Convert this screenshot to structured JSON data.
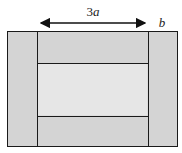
{
  "diagram": {
    "type": "rectangular-frame",
    "labels": {
      "width_label": "3a",
      "border_label": "b"
    },
    "colors": {
      "background": "#ffffff",
      "border_band": "#d4d4d4",
      "center_panel": "#e6e6e6",
      "stroke": "#1a1a1a"
    },
    "regions": [
      {
        "name": "left-band"
      },
      {
        "name": "right-band"
      },
      {
        "name": "top-band"
      },
      {
        "name": "bottom-band"
      },
      {
        "name": "center-panel"
      }
    ]
  }
}
